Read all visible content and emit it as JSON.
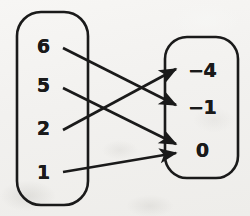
{
  "diagram": {
    "type": "mapping-diagram",
    "title": "",
    "ink_color": "#1a1a1a",
    "paper_color": "#f2f1ef",
    "domain_set": {
      "label": "",
      "items": [
        {
          "value": "6",
          "x": 43,
          "y": 46
        },
        {
          "value": "5",
          "x": 43,
          "y": 85
        },
        {
          "value": "2",
          "x": 43,
          "y": 128
        },
        {
          "value": "1",
          "x": 43,
          "y": 172
        }
      ],
      "box": {
        "x": 17,
        "y": 12,
        "width": 71,
        "height": 193,
        "radius": 24
      }
    },
    "range_set": {
      "label": "",
      "items": [
        {
          "value": "−4",
          "x": 202,
          "y": 70
        },
        {
          "value": "−1",
          "x": 202,
          "y": 107
        },
        {
          "value": "0",
          "x": 202,
          "y": 150
        }
      ],
      "box": {
        "x": 165,
        "y": 37,
        "width": 73,
        "height": 141,
        "radius": 22
      }
    },
    "arrows": [
      {
        "from": "6",
        "to": "−1",
        "x1": 63,
        "y1": 48,
        "x2": 176,
        "y2": 105
      },
      {
        "from": "5",
        "to": "0",
        "x1": 63,
        "y1": 88,
        "x2": 176,
        "y2": 144
      },
      {
        "from": "2",
        "to": "−4",
        "x1": 63,
        "y1": 130,
        "x2": 176,
        "y2": 69
      },
      {
        "from": "1",
        "to": "0",
        "x1": 63,
        "y1": 172,
        "x2": 176,
        "y2": 153
      }
    ]
  }
}
